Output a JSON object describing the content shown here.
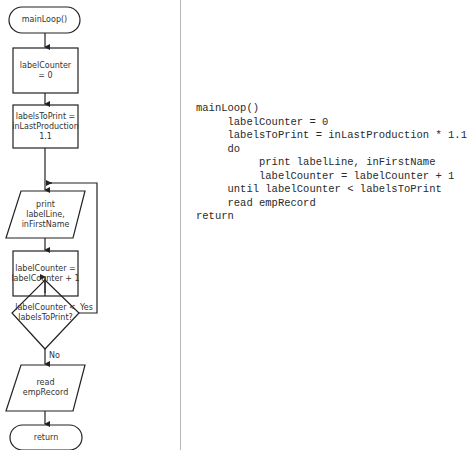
{
  "flowchart": {
    "nodes": [
      {
        "id": "start",
        "type": "terminator",
        "text": "mainLoop()"
      },
      {
        "id": "init-counter",
        "type": "process",
        "text": "labelCounter\n= 0"
      },
      {
        "id": "calc-labels",
        "type": "process",
        "text": "labelsToPrint =\ninLastProduction\n1.1"
      },
      {
        "id": "print-label",
        "type": "io",
        "text": "print\nlabelLine,\ninFirstName"
      },
      {
        "id": "increment",
        "type": "process",
        "text": "labelCounter =\nlabelCounter + 1"
      },
      {
        "id": "decision",
        "type": "decision",
        "text": "labelCounter <\nlabelsToPrint?"
      },
      {
        "id": "read-record",
        "type": "io",
        "text": "read\nempRecord"
      },
      {
        "id": "end",
        "type": "terminator",
        "text": "return"
      }
    ],
    "edge_labels": {
      "yes": "Yes",
      "no": "No"
    }
  },
  "pseudocode": {
    "lines": [
      "mainLoop()",
      "     labelCounter = 0",
      "     labelsToPrint = inLastProduction * 1.1",
      "     do",
      "          print labelLine, inFirstName",
      "          labelCounter = labelCounter + 1",
      "     until labelCounter < labelsToPrint",
      "     read empRecord",
      "return"
    ]
  },
  "colors": {
    "stroke": "#222222",
    "divider": "#b5b5b5",
    "text": "#333333"
  }
}
